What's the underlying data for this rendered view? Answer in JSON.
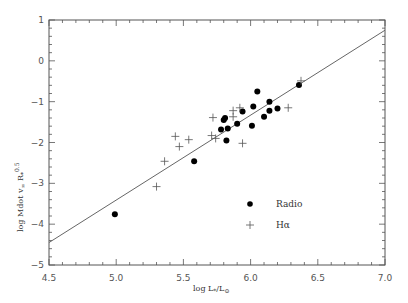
{
  "chart_data": {
    "type": "scatter",
    "title": "",
    "xlabel": "log L*/L⊙",
    "ylabel": "log Mdot v∞ R*^0.5",
    "xlim": [
      4.5,
      7.0
    ],
    "ylim": [
      -5,
      1
    ],
    "xticks": [
      4.5,
      5.0,
      5.5,
      6.0,
      6.5,
      7.0
    ],
    "xtick_labels": [
      "4.5",
      "5.0",
      "5.5",
      "6.0",
      "6.5",
      "7.0"
    ],
    "yticks": [
      -5,
      -4,
      -3,
      -2,
      -1,
      0,
      1
    ],
    "ytick_labels": [
      "−5",
      "−4",
      "−3",
      "−2",
      "−1",
      "0",
      "1"
    ],
    "grid": false,
    "legend_position": "lower right",
    "series": [
      {
        "name": "Radio",
        "marker": "filled-circle",
        "points": [
          [
            4.99,
            -3.76
          ],
          [
            5.58,
            -2.46
          ],
          [
            5.78,
            -1.68
          ],
          [
            5.8,
            -1.45
          ],
          [
            5.81,
            -1.4
          ],
          [
            5.82,
            -1.95
          ],
          [
            5.83,
            -1.66
          ],
          [
            5.9,
            -1.54
          ],
          [
            5.94,
            -1.24
          ],
          [
            6.01,
            -1.59
          ],
          [
            6.02,
            -1.12
          ],
          [
            6.05,
            -0.75
          ],
          [
            6.1,
            -1.37
          ],
          [
            6.14,
            -1.0
          ],
          [
            6.14,
            -1.22
          ],
          [
            6.2,
            -1.17
          ],
          [
            6.36,
            -0.59
          ]
        ]
      },
      {
        "name": "Hα",
        "marker": "plus",
        "points": [
          [
            5.3,
            -3.08
          ],
          [
            5.36,
            -2.46
          ],
          [
            5.44,
            -1.85
          ],
          [
            5.47,
            -2.1
          ],
          [
            5.54,
            -1.93
          ],
          [
            5.71,
            -1.83
          ],
          [
            5.72,
            -1.39
          ],
          [
            5.74,
            -1.9
          ],
          [
            5.87,
            -1.22
          ],
          [
            5.87,
            -1.37
          ],
          [
            5.92,
            -1.15
          ],
          [
            5.94,
            -2.02
          ],
          [
            6.28,
            -1.15
          ],
          [
            6.375,
            -0.49
          ]
        ]
      }
    ],
    "fit_line": {
      "x": [
        4.5,
        7.0
      ],
      "y": [
        -4.45,
        0.75
      ]
    },
    "legend": [
      {
        "label": "Radio",
        "marker": "filled-circle"
      },
      {
        "label": "Hα",
        "marker": "plus"
      }
    ]
  },
  "axes": {
    "x_label_text": "log L",
    "x_label_sub1": "*",
    "x_label_slash": "/L",
    "x_label_sub2": "⊙",
    "y_label_text": "log  Mdot  v",
    "y_label_sub1": "∞",
    "y_label_r": " R",
    "y_label_sub2": "*",
    "y_label_sup": "0.5"
  },
  "colors": {
    "axis": "#555555",
    "line": "#666666",
    "marker": "#000000",
    "plus": "#555555"
  }
}
